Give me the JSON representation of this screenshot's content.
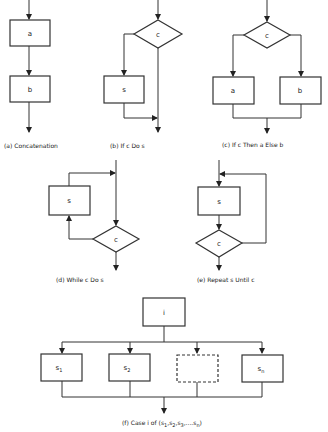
{
  "panels": {
    "a": {
      "caption": "(a) Concatenation",
      "boxes": [
        "a",
        "b"
      ]
    },
    "b": {
      "caption": "(b) If c Do s",
      "decision": "c",
      "boxes": [
        "s"
      ]
    },
    "c": {
      "caption": "(c) If c Then a Else b",
      "decision": "c",
      "boxes": [
        "a",
        "b"
      ]
    },
    "d": {
      "caption": "(d) While c Do s",
      "decision": "c",
      "boxes": [
        "s"
      ]
    },
    "e": {
      "caption": "(e) Repeat s Until c",
      "decision": "c",
      "boxes": [
        "s"
      ]
    },
    "f": {
      "caption_prefix": "(f) Case i of (",
      "caption_items": [
        "s",
        "1",
        ",s",
        "2",
        ",s",
        "3",
        ",....s",
        "n",
        ")"
      ],
      "selector": "i",
      "cases": [
        {
          "label": "s",
          "sub": "1"
        },
        {
          "label": "s",
          "sub": "2"
        },
        {
          "label": "",
          "sub": "",
          "dashed": true
        },
        {
          "label": "s",
          "sub": "n"
        }
      ]
    }
  }
}
